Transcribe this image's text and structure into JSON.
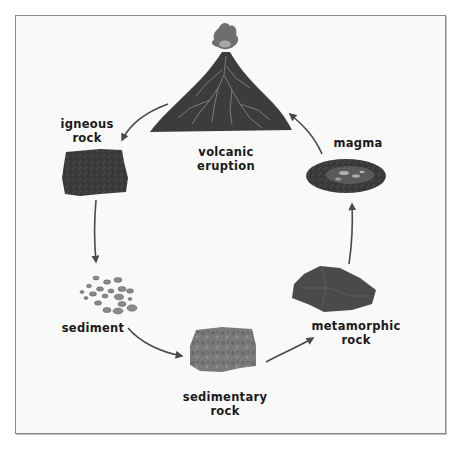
{
  "diagram": {
    "nodes": [
      {
        "id": "volcanic-eruption",
        "label_line1": "volcanic",
        "label_line2": "eruption"
      },
      {
        "id": "igneous-rock",
        "label_line1": "igneous",
        "label_line2": "rock"
      },
      {
        "id": "sediment",
        "label_line1": "sediment",
        "label_line2": ""
      },
      {
        "id": "sedimentary-rock",
        "label_line1": "sedimentary",
        "label_line2": "rock"
      },
      {
        "id": "metamorphic-rock",
        "label_line1": "metamorphic",
        "label_line2": "rock"
      },
      {
        "id": "magma",
        "label_line1": "magma",
        "label_line2": ""
      }
    ],
    "edges": [
      {
        "from": "volcanic-eruption",
        "to": "igneous-rock"
      },
      {
        "from": "igneous-rock",
        "to": "sediment"
      },
      {
        "from": "sediment",
        "to": "sedimentary-rock"
      },
      {
        "from": "sedimentary-rock",
        "to": "metamorphic-rock"
      },
      {
        "from": "metamorphic-rock",
        "to": "magma"
      },
      {
        "from": "magma",
        "to": "volcanic-eruption"
      }
    ],
    "colors": {
      "frame_border": "#8a8a8a",
      "background": "#f9f9f9",
      "arrow": "#4a4a4a",
      "text": "#1a1a1a"
    }
  }
}
